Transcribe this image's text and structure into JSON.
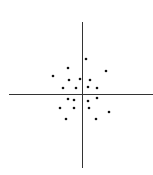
{
  "chart_data": {
    "type": "scatter",
    "title": "",
    "xlabel": "",
    "ylabel": "",
    "grid": false,
    "legend": null,
    "axes_style": "cross-through-origin",
    "axis_pixels": {
      "x_axis_y": 94,
      "x_axis_from": 9,
      "x_axis_to": 153,
      "y_axis_x": 82,
      "y_axis_from": 22,
      "y_axis_to": 168
    },
    "points_px": [
      [
        86,
        59
      ],
      [
        68,
        68
      ],
      [
        106,
        71
      ],
      [
        53,
        76
      ],
      [
        69,
        80
      ],
      [
        80,
        79
      ],
      [
        90,
        80
      ],
      [
        63,
        88
      ],
      [
        76,
        88
      ],
      [
        88,
        87
      ],
      [
        97,
        88
      ],
      [
        68,
        99
      ],
      [
        74,
        100
      ],
      [
        88,
        101
      ],
      [
        97,
        98
      ],
      [
        60,
        108
      ],
      [
        74,
        108
      ],
      [
        89,
        108
      ],
      [
        109,
        112
      ],
      [
        66,
        119
      ],
      [
        96,
        119
      ]
    ],
    "points": [
      {
        "x": 0.3,
        "y": 2.5
      },
      {
        "x": -1.0,
        "y": 1.9
      },
      {
        "x": 1.7,
        "y": 1.7
      },
      {
        "x": -2.0,
        "y": 1.3
      },
      {
        "x": -0.9,
        "y": 1.0
      },
      {
        "x": -0.1,
        "y": 1.1
      },
      {
        "x": 0.6,
        "y": 1.0
      },
      {
        "x": -1.3,
        "y": 0.4
      },
      {
        "x": -0.4,
        "y": 0.4
      },
      {
        "x": 0.4,
        "y": 0.5
      },
      {
        "x": 1.1,
        "y": 0.4
      },
      {
        "x": -1.0,
        "y": -0.4
      },
      {
        "x": -0.6,
        "y": -0.4
      },
      {
        "x": 0.4,
        "y": -0.5
      },
      {
        "x": 1.1,
        "y": -0.3
      },
      {
        "x": -1.6,
        "y": -1.0
      },
      {
        "x": -0.6,
        "y": -1.0
      },
      {
        "x": 0.5,
        "y": -1.0
      },
      {
        "x": 1.9,
        "y": -1.3
      },
      {
        "x": -1.1,
        "y": -1.8
      },
      {
        "x": 1.0,
        "y": -1.8
      }
    ],
    "colors": {
      "axis": "#333333",
      "point": "#111111",
      "background": "#ffffff"
    }
  }
}
